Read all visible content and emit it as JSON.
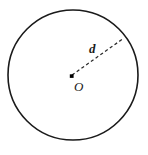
{
  "figure": {
    "type": "geometry-diagram",
    "background_color": "#ffffff",
    "stroke_color": "#1a1a1a",
    "dash_color": "#2b2b2b",
    "canvas": {
      "width": 148,
      "height": 155
    },
    "circle": {
      "center_x": 73,
      "center_y": 75,
      "radius": 65,
      "fill": "#ffffff",
      "stroke_width": 1.6
    },
    "center_point": {
      "x": 71.5,
      "y": 76,
      "size": 3.6,
      "shape": "filled-square"
    },
    "radius_segment": {
      "x1": 72,
      "y1": 75,
      "x2": 124,
      "y2": 38,
      "style": "dashed"
    },
    "labels": {
      "radius_label": "d",
      "radius_label_x": 89,
      "radius_label_y": 53,
      "center_label": "O",
      "center_label_x": 74,
      "center_label_y": 91
    }
  }
}
